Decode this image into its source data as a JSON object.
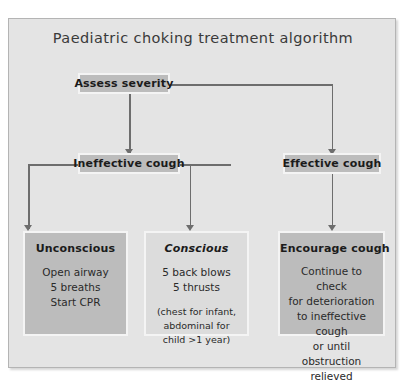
{
  "title": "Paediatric choking treatment algorithm",
  "nodes": {
    "assess": {
      "label": "Assess severity"
    },
    "ineffective": {
      "label": "Ineffective cough"
    },
    "effective": {
      "label": "Effective cough"
    },
    "unconscious": {
      "header": "Unconscious",
      "lines": [
        "Open airway",
        "5 breaths",
        "Start CPR"
      ]
    },
    "conscious": {
      "header": "Conscious",
      "lines": [
        "5 back blows",
        "5 thrusts"
      ],
      "note": [
        "(chest for infant,",
        "abdominal for",
        "child >1 year)"
      ]
    },
    "encourage": {
      "header": "Encourage cough",
      "lines": [
        "Continue to check",
        "for deterioration",
        "to ineffective cough",
        "or until obstruction",
        "relieved"
      ]
    }
  },
  "colors": {
    "panel_background": "#e4e4e4",
    "node_fill": "#bcbcbc",
    "node_fill_light": "#dcdcdc",
    "node_border": "#f4f4f4",
    "connector": "#6d6d6d",
    "title_text": "#3a3a3a",
    "body_text": "#2a2a2a"
  }
}
